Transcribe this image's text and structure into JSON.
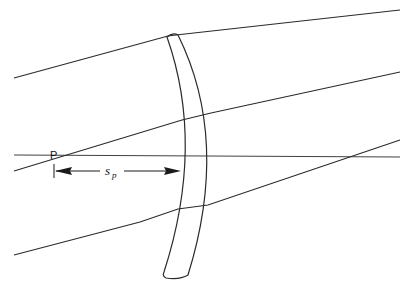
{
  "diagram": {
    "type": "optics-ray-diagram",
    "labels": {
      "point": "P",
      "distance_main": "s",
      "distance_sub": "p"
    },
    "colors": {
      "line": "#2a2a2a",
      "background": "#ffffff"
    },
    "elements": {
      "optical_axis": {
        "from": [
          14,
          155
        ],
        "to": [
          400,
          157
        ]
      },
      "rays": [
        {
          "name": "top-ray",
          "points": [
            [
              14,
              78
            ],
            [
              170,
              35
            ],
            [
              400,
              10
            ]
          ]
        },
        {
          "name": "middle-ray",
          "points": [
            [
              14,
              171
            ],
            [
              170,
              120
            ],
            [
              400,
              72
            ]
          ]
        },
        {
          "name": "lower-ray",
          "points": [
            [
              14,
              255
            ],
            [
              180,
              208
            ],
            [
              214,
              203
            ],
            [
              400,
              140
            ]
          ]
        }
      ],
      "lens": {
        "shape": "meniscus",
        "top": [
          172,
          35
        ],
        "bottom": [
          170,
          278
        ]
      },
      "dimension_arrow": {
        "start_x": 53,
        "end_x": 180,
        "y": 171
      }
    }
  }
}
